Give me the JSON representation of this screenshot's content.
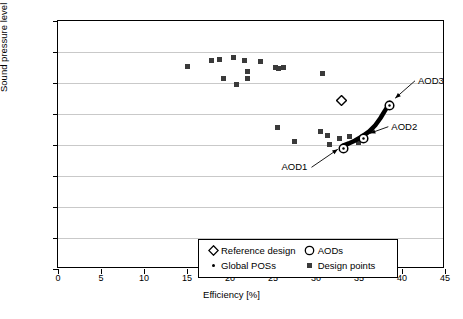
{
  "chart_data": {
    "type": "scatter",
    "title": "",
    "xlabel": "Efficiency [%]",
    "ylabel": "Sound pressure level [dB]",
    "xlim": [
      0,
      45
    ],
    "ylim": [
      60,
      140
    ],
    "xticks": [
      0,
      5,
      10,
      15,
      20,
      25,
      30,
      35,
      40,
      45
    ],
    "yticks": [
      60,
      70,
      80,
      90,
      100,
      110,
      120,
      130,
      140
    ],
    "grid": "horizontal",
    "legend_position": "lower-center-inside",
    "series": [
      {
        "name": "Design points",
        "marker": "square",
        "color": "#3a3a3a",
        "points": [
          [
            15.1,
            125.2
          ],
          [
            17.9,
            127.2
          ],
          [
            18.8,
            127.6
          ],
          [
            19.2,
            121.5
          ],
          [
            20.4,
            128.3
          ],
          [
            20.8,
            119.5
          ],
          [
            21.7,
            127.4
          ],
          [
            22.0,
            123.6
          ],
          [
            22.0,
            121.5
          ],
          [
            23.5,
            126.9
          ],
          [
            25.3,
            124.9
          ],
          [
            25.6,
            124.6
          ],
          [
            26.2,
            125.0
          ],
          [
            30.7,
            123.0
          ],
          [
            25.5,
            105.5
          ],
          [
            27.5,
            101.1
          ],
          [
            30.5,
            104.4
          ],
          [
            31.3,
            103.0
          ],
          [
            31.6,
            100.3
          ],
          [
            32.7,
            102.1
          ],
          [
            33.9,
            102.6
          ],
          [
            34.9,
            100.8
          ]
        ]
      },
      {
        "name": "Reference design",
        "marker": "diamond",
        "color": "#000000",
        "points": [
          [
            33.0,
            115.2
          ]
        ]
      },
      {
        "name": "AODs",
        "marker": "circle",
        "color": "#000000",
        "points": [
          [
            33.2,
            99.9
          ],
          [
            35.5,
            103.0
          ],
          [
            38.6,
            113.6
          ]
        ],
        "labels": [
          "AOD1",
          "AOD2",
          "AOD3"
        ]
      },
      {
        "name": "Global POSs",
        "marker": "dot",
        "color": "#000000",
        "description": "Thick black Pareto front curve connecting AOD1 through AOD3",
        "points": [
          [
            33.2,
            99.9
          ],
          [
            33.8,
            100.5
          ],
          [
            34.5,
            101.4
          ],
          [
            35.1,
            102.4
          ],
          [
            35.5,
            103.0
          ],
          [
            36.2,
            104.4
          ],
          [
            36.9,
            106.4
          ],
          [
            37.5,
            108.7
          ],
          [
            38.0,
            111.0
          ],
          [
            38.4,
            112.7
          ],
          [
            38.6,
            113.6
          ]
        ]
      }
    ],
    "annotations": [
      {
        "text": "AOD1",
        "target": [
          33.2,
          99.9
        ]
      },
      {
        "text": "AOD2",
        "target": [
          35.5,
          103.0
        ]
      },
      {
        "text": "AOD3",
        "target": [
          38.6,
          113.6
        ]
      }
    ]
  },
  "legend": {
    "entries": [
      {
        "label": "Reference design",
        "symbol": "diamond-marker"
      },
      {
        "label": "AODs",
        "symbol": "circle-marker"
      },
      {
        "label": "Global POSs",
        "symbol": "dot-marker"
      },
      {
        "label": "Design points",
        "symbol": "square-marker"
      }
    ]
  }
}
